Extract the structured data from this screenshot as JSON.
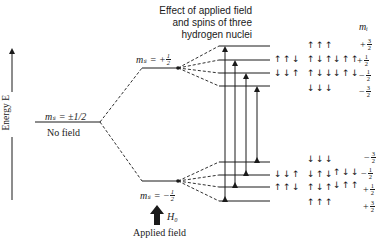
{
  "title_lines": [
    "Effect of applied field",
    "and spins of three",
    "hydrogen nuclei"
  ],
  "axis_label": "Energy E",
  "no_field": {
    "ms_label": "mₛ = ±1/2",
    "label": "No field"
  },
  "upper_level": {
    "ms_prefix": "mₛ = +",
    "num": "1",
    "den": "2"
  },
  "lower_level": {
    "ms_prefix": "mₛ = −",
    "num": "1",
    "den": "2"
  },
  "applied_field": {
    "symbol": "H₀",
    "label": "Applied field"
  },
  "mi_header": "mᵢ",
  "upper_states": [
    {
      "mi_sign": "+",
      "num": "3",
      "den": "2",
      "spins": [
        [
          "↑↑↑"
        ]
      ]
    },
    {
      "mi_sign": "+",
      "num": "1",
      "den": "2",
      "spins": [
        [
          "↑↑↓"
        ],
        [
          "↑↓↑"
        ],
        [
          "↓↑↑"
        ]
      ]
    },
    {
      "mi_sign": "−",
      "num": "1",
      "den": "2",
      "spins": [
        [
          "↓↓↑"
        ],
        [
          "↑↓↓"
        ],
        [
          "↓↑↓"
        ]
      ]
    },
    {
      "mi_sign": "−",
      "num": "3",
      "den": "2",
      "spins": [
        [
          "↓↓↓"
        ]
      ]
    }
  ],
  "lower_states": [
    {
      "mi_sign": "−",
      "num": "3",
      "den": "2",
      "spins": [
        [
          "↓↓↓"
        ]
      ]
    },
    {
      "mi_sign": "−",
      "num": "1",
      "den": "2",
      "spins": [
        [
          "↓↓↑"
        ],
        [
          "↓↑↓"
        ],
        [
          "↑↓↓"
        ]
      ]
    },
    {
      "mi_sign": "+",
      "num": "1",
      "den": "2",
      "spins": [
        [
          "↑↑↓"
        ],
        [
          "↑↓↑"
        ],
        [
          "↓↑↑"
        ]
      ]
    },
    {
      "mi_sign": "+",
      "num": "3",
      "den": "2",
      "spins": [
        [
          "↑↑↑"
        ]
      ]
    }
  ],
  "spin_labels": {
    "u1": "↑↑↓",
    "u2": "↓↓↑",
    "u_top": "↑↑↑",
    "u_p1_a": "↑↓↑",
    "u_p1_b": "↓↑↑",
    "u_m1_a": "↑↓↓",
    "u_m1_b": "↓↑↓",
    "u_bot": "↓↓↓",
    "l1": "↓↓↑",
    "l2": "↑↑↓",
    "l_top": "↓↓↓",
    "l_m1_a": "↓↑↓",
    "l_m1_b": "↑↓↓",
    "l_p1_a": "↑↓↑",
    "l_p1_b": "↓↑↑",
    "l_bot": "↑↑↑"
  },
  "mi_values": {
    "upper": [
      {
        "sign": "+",
        "num": "3",
        "den": "2"
      },
      {
        "sign": "+",
        "num": "1",
        "den": "2"
      },
      {
        "sign": "−",
        "num": "1",
        "den": "2"
      },
      {
        "sign": "−",
        "num": "3",
        "den": "2"
      }
    ],
    "lower": [
      {
        "sign": "−",
        "num": "3",
        "den": "2"
      },
      {
        "sign": "−",
        "num": "1",
        "den": "2"
      },
      {
        "sign": "+",
        "num": "1",
        "den": "2"
      },
      {
        "sign": "+",
        "num": "3",
        "den": "2"
      }
    ]
  },
  "transitions": 4
}
